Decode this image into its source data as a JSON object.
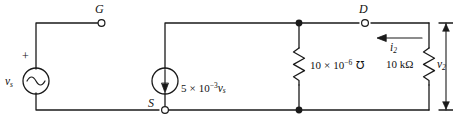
{
  "figure": {
    "background_color": "#ffffff",
    "line_color": "#1a1a1a"
  },
  "nodes": {
    "gate": {
      "label": "G",
      "terminal_type": "open-circle"
    },
    "source": {
      "label": "S",
      "terminal_type": "open-circle"
    },
    "drain": {
      "label": "D",
      "terminal_type": "open-circle"
    }
  },
  "components": {
    "source_vs": {
      "kind": "independent-voltage-source",
      "symbol": "sine",
      "label": "v",
      "label_sub": "s",
      "polarity": "+"
    },
    "dependent_source": {
      "kind": "dependent-current-source",
      "symbol": "arrow-down",
      "coefficient": "5",
      "times": "×",
      "base": "10",
      "exponent": "−3",
      "controlling": "v",
      "controlling_sub": "s",
      "label_full": "5 × 10−3vs"
    },
    "conductance": {
      "kind": "resistor",
      "coefficient": "10",
      "times": "×",
      "base": "10",
      "exponent": "−6",
      "unit": "℧",
      "label_full": "10 × 10−6 ℧"
    },
    "load_resistor": {
      "kind": "resistor",
      "value": "10 kΩ",
      "label_full": "10 kΩ"
    }
  },
  "measurements": {
    "current_i2": {
      "label": "i",
      "label_sub": "2",
      "direction": "left",
      "label_full": "i2"
    },
    "voltage_v2": {
      "label": "v",
      "label_sub": "2",
      "direction": "vertical-double-arrow",
      "label_full": "v2"
    }
  }
}
